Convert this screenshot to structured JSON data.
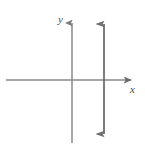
{
  "figure": {
    "kind": "cartesian-graph",
    "title": "",
    "width": 145,
    "height": 153,
    "background_color": "#ffffff"
  },
  "labels": {
    "y_axis": "y",
    "x_axis": "x"
  },
  "colors": {
    "axis": "#8a8a8a",
    "curve": "#6e6e6e",
    "label": "#4a4a4a",
    "background": "#ffffff"
  },
  "chart_data": {
    "type": "line",
    "title": "",
    "xlabel": "x",
    "ylabel": "y",
    "grid": false,
    "legend": "none",
    "xlim": [
      -4.5,
      4.5
    ],
    "ylim": [
      -4.5,
      4.5
    ],
    "origin_px": [
      72,
      80
    ],
    "axes": [
      {
        "name": "x-axis",
        "orientation": "horizontal",
        "start_px": [
          6,
          80
        ],
        "end_px": [
          137,
          80
        ],
        "arrow_start": false,
        "arrow_end": true
      },
      {
        "name": "y-axis",
        "orientation": "vertical",
        "start_px": [
          72,
          143
        ],
        "end_px": [
          72,
          17
        ],
        "arrow_start": false,
        "arrow_end": true
      }
    ],
    "series": [
      {
        "name": "vertical-line",
        "equation": "x = 2",
        "type": "vertical-line",
        "x": 2,
        "orientation": "vertical",
        "start_px": [
          104,
          141
        ],
        "end_px": [
          104,
          17
        ],
        "arrow_start": true,
        "arrow_end": true,
        "color": "#6e6e6e"
      }
    ],
    "xticks": [],
    "yticks": [],
    "annotations": []
  }
}
